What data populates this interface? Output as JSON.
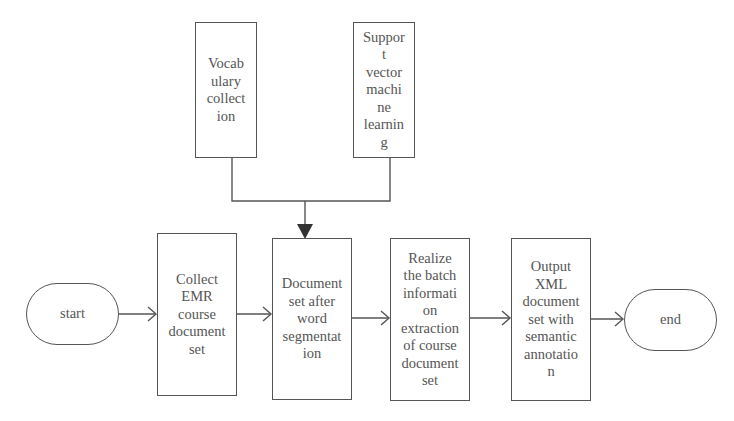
{
  "diagram": {
    "type": "flowchart",
    "nodes": {
      "vocab": {
        "label": "Vocab\nulary\ncollect\nion",
        "shape": "rect"
      },
      "svm": {
        "label": "Suppor\nt\nvector\nmachi\nne\nlearnin\ng",
        "shape": "rect"
      },
      "start": {
        "label": "start",
        "shape": "terminator"
      },
      "collect": {
        "label": "Collect\nEMR\ncourse\ndocument\nset",
        "shape": "rect"
      },
      "segment": {
        "label": "Document\nset after\nword\nsegmentat\nion",
        "shape": "rect"
      },
      "realize": {
        "label": "Realize\nthe batch\ninformati\non\nextraction\nof course\ndocument\nset",
        "shape": "rect"
      },
      "output": {
        "label": "Output\nXML\ndocument\nset with\nsemantic\nannotatio\nn",
        "shape": "rect"
      },
      "end": {
        "label": "end",
        "shape": "terminator"
      }
    },
    "edges": [
      {
        "from": "vocab",
        "to": "segment",
        "style": "merge-solid-arrow"
      },
      {
        "from": "svm",
        "to": "segment",
        "style": "merge-solid-arrow"
      },
      {
        "from": "start",
        "to": "collect",
        "style": "open-arrow"
      },
      {
        "from": "collect",
        "to": "segment",
        "style": "open-arrow"
      },
      {
        "from": "segment",
        "to": "realize",
        "style": "open-arrow"
      },
      {
        "from": "realize",
        "to": "output",
        "style": "open-arrow"
      },
      {
        "from": "output",
        "to": "end",
        "style": "open-arrow"
      }
    ],
    "colors": {
      "line": "#555555",
      "background": "#ffffff",
      "text": "#555555"
    }
  }
}
